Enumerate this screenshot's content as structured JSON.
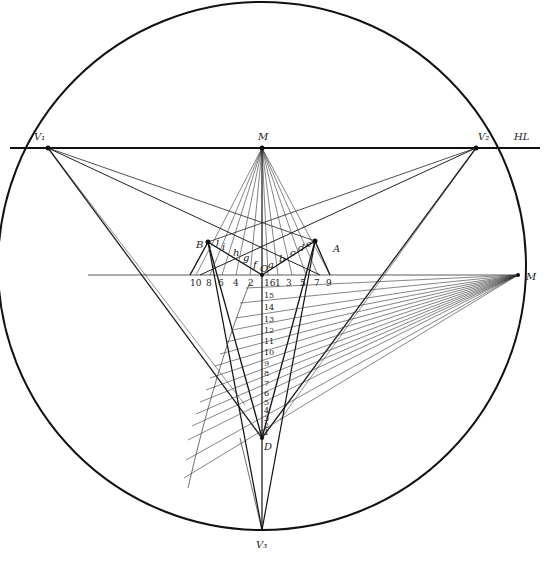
{
  "diagram": {
    "circle": {
      "cx": 262,
      "cy": 266,
      "r": 264
    },
    "horizon_label": "HL",
    "points": {
      "V1": {
        "label": "V₁",
        "x": 48,
        "y": 148
      },
      "V2": {
        "label": "V₂",
        "x": 476,
        "y": 148
      },
      "V3": {
        "label": "V₃",
        "x": 262,
        "y": 530
      },
      "M_top": {
        "label": "M",
        "x": 262,
        "y": 148
      },
      "M_right": {
        "label": "M",
        "x": 518,
        "y": 275
      },
      "O": {
        "label": "O",
        "x": 262,
        "y": 275
      },
      "A": {
        "label": "A",
        "x": 315,
        "y": 241
      },
      "B": {
        "label": "B",
        "x": 208,
        "y": 242
      },
      "D": {
        "label": "D",
        "x": 262,
        "y": 438
      }
    },
    "edge_letters_right": [
      "a",
      "b",
      "c",
      "d",
      "e"
    ],
    "edge_letters_left": [
      "f",
      "g",
      "h",
      "i",
      "j"
    ],
    "baseline_numbers_left": [
      "10",
      "8",
      "6",
      "4",
      "2"
    ],
    "baseline_numbers_right": [
      "16",
      "1",
      "3",
      "5",
      "7",
      "9"
    ],
    "vertical_scale": [
      "15",
      "14",
      "13",
      "12",
      "11",
      "10",
      "9",
      "8",
      "7",
      "6",
      "5",
      "4",
      "3",
      "2",
      "1"
    ],
    "colors": {
      "line": "#111111",
      "thin": "#333333",
      "background": "#ffffff"
    }
  }
}
